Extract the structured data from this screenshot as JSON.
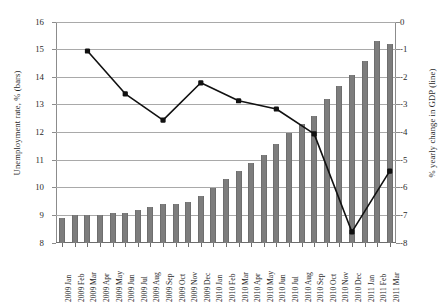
{
  "chart_data": {
    "type": "bar",
    "title": "",
    "subtitle": "",
    "xlabel": "",
    "ylabel": "Unemployment rate, % (bars)",
    "y2label": "% yearly change in GDP (line)",
    "grid": true,
    "legend": "none",
    "ylim": [
      8,
      16
    ],
    "y2lim": [
      -8,
      0
    ],
    "yticks": [
      "8",
      "9",
      "10",
      "11",
      "12",
      "13",
      "14",
      "15",
      "16"
    ],
    "y2ticks": [
      "0",
      "-1",
      "-2",
      "-3",
      "-4",
      "-5",
      "-6",
      "-7",
      "-8"
    ],
    "categories": [
      "2009 Jan",
      "2009 Feb",
      "2009 Mar",
      "2009 Apr",
      "2009 May",
      "2009 Jun",
      "2009 Jul",
      "2009 Aug",
      "2009 Sep",
      "2009 Oct",
      "2009 Nov",
      "2009 Dec",
      "2010 Jan",
      "2010 Feb",
      "2010 Mar",
      "2010 Apr",
      "2010 May",
      "2010 Jun",
      "2010 Jul",
      "2010 Aug",
      "2010 Sep",
      "2010 Oct",
      "2010 Nov",
      "2010 Dec",
      "2011 Jan",
      "2011 Feb",
      "2011 Mar"
    ],
    "series": [
      {
        "name": "Unemployment rate, % (bars)",
        "type": "bar",
        "axis": "left",
        "color": "#7d7d7d",
        "values": [
          8.9,
          9.0,
          9.0,
          9.0,
          9.1,
          9.1,
          9.2,
          9.3,
          9.4,
          9.4,
          9.5,
          9.7,
          10.0,
          10.3,
          10.6,
          10.9,
          11.2,
          11.6,
          12.0,
          12.3,
          12.6,
          13.2,
          13.7,
          14.1,
          14.6,
          15.3,
          15.2
        ]
      },
      {
        "name": "% yearly change in GDP (line)",
        "type": "line",
        "axis": "right",
        "color": "#111111",
        "marker": "square",
        "points": [
          {
            "category": "2009 Mar",
            "value": -1.05
          },
          {
            "category": "2009 Jun",
            "value": -2.6
          },
          {
            "category": "2009 Sep",
            "value": -3.55
          },
          {
            "category": "2009 Dec",
            "value": -2.2
          },
          {
            "category": "2010 Mar",
            "value": -2.85
          },
          {
            "category": "2010 Jun",
            "value": -3.15
          },
          {
            "category": "2010 Sep",
            "value": -4.05
          },
          {
            "category": "2010 Dec",
            "value": -7.6
          },
          {
            "category": "2011 Mar",
            "value": -5.4
          }
        ]
      }
    ]
  }
}
